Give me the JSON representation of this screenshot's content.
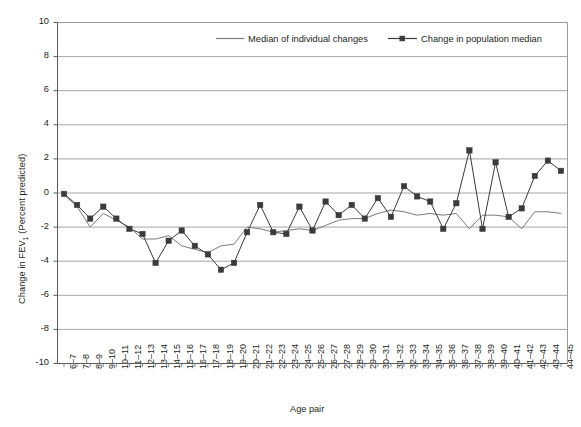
{
  "chart_data": {
    "type": "line",
    "title": "",
    "xlabel": "Age pair",
    "ylabel": "Change in FEV1 (Percent predicted)",
    "ylabel_main": "Change in FEV",
    "ylabel_sub": "1",
    "ylabel_tail": " (Percent predicted)",
    "ylim": [
      -10,
      10
    ],
    "ytick_step": 2,
    "yticks": [
      "10",
      "8",
      "6",
      "4",
      "2",
      "0",
      "-2",
      "-4",
      "-6",
      "-8",
      "-10"
    ],
    "grid": "horizontal",
    "legend_position": "top-center-inside",
    "categories": [
      "6–7",
      "7–8",
      "8–9",
      "9–10",
      "10–11",
      "11–12",
      "12–13",
      "13–14",
      "14–15",
      "15–16",
      "16–17",
      "17–18",
      "18–19",
      "19–20",
      "20–21",
      "21–22",
      "22–23",
      "23–24",
      "24–25",
      "25–26",
      "26–27",
      "27–28",
      "28–29",
      "29–30",
      "30–31",
      "31–32",
      "32–33",
      "33–34",
      "34–35",
      "35–36",
      "36–37",
      "37–38",
      "38–39",
      "39–40",
      "40–41",
      "41–42",
      "42–43",
      "43–44",
      "44–45"
    ],
    "series": [
      {
        "name": "Median of individual changes",
        "marker": "none",
        "color": "#7a7a7a",
        "width": 1.0,
        "values": [
          -0.1,
          -0.8,
          -2.0,
          -1.2,
          -1.6,
          -2.0,
          -2.7,
          -2.7,
          -2.5,
          -3.1,
          -3.3,
          -3.5,
          -3.1,
          -3.0,
          -2.0,
          -2.1,
          -2.3,
          -2.2,
          -2.1,
          -2.2,
          -1.9,
          -1.6,
          -1.5,
          -1.5,
          -1.2,
          -1.0,
          -1.1,
          -1.3,
          -1.2,
          -1.3,
          -1.2,
          -2.1,
          -1.3,
          -1.3,
          -1.4,
          -2.1,
          -1.1,
          -1.1,
          -1.2
        ]
      },
      {
        "name": "Change in population median",
        "marker": "square",
        "color": "#3b3b3b",
        "width": 1.0,
        "values": [
          -0.05,
          -0.7,
          -1.5,
          -0.8,
          -1.5,
          -2.1,
          -2.4,
          -4.1,
          -2.8,
          -2.2,
          -3.1,
          -3.6,
          -4.5,
          -4.1,
          -2.3,
          -0.7,
          -2.3,
          -2.4,
          -0.8,
          -2.2,
          -0.5,
          -1.3,
          -0.7,
          -1.5,
          -0.3,
          -1.4,
          0.4,
          -0.2,
          -0.5,
          -2.1,
          -0.6,
          2.5,
          -2.1,
          1.8,
          -1.4,
          -0.9,
          1.0,
          1.9,
          1.3
        ]
      }
    ]
  },
  "legend": {
    "items": [
      {
        "label": "Median of individual changes",
        "style": "line"
      },
      {
        "label": "Change in population median",
        "style": "line-marker"
      }
    ]
  }
}
